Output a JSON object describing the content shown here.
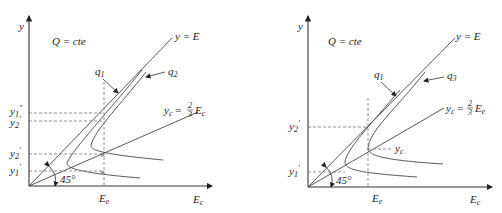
{
  "left_panel": {
    "y_axis_label": "y",
    "x_axis_label": "E",
    "x_axis_label_sub": "c",
    "condition": "Q = cte",
    "line_label": "y = E",
    "curve_labels": {
      "q1": "q",
      "q1_sub": "1",
      "q2": "q",
      "q2_sub": "2"
    },
    "critical_line": {
      "lhs": "y",
      "lhs_sub": "c",
      "eq": "=",
      "num": "2",
      "den": "3",
      "rhs": "E",
      "rhs_sub": "c"
    },
    "x_tick": {
      "label": "E",
      "sub": "e"
    },
    "y_ticks": [
      {
        "label": "y",
        "sub": "1",
        "sup": "\""
      },
      {
        "label": "y",
        "sub": "2",
        "sup": "'"
      },
      {
        "label": "y",
        "sub": "2",
        "sup": "'"
      },
      {
        "label": "y",
        "sub": "1",
        "sup": "'"
      }
    ],
    "angle_label": "45°"
  },
  "right_panel": {
    "y_axis_label": "y",
    "x_axis_label": "E",
    "x_axis_label_sub": "c",
    "condition": "Q = cte",
    "line_label": "y = E",
    "curve_labels": {
      "q1": "q",
      "q1_sub": "1",
      "q3": "q",
      "q3_sub": "3"
    },
    "critical_line": {
      "lhs": "y",
      "lhs_sub": "c",
      "eq": "=",
      "num": "2",
      "den": "3",
      "rhs": "E",
      "rhs_sub": "e"
    },
    "x_tick": {
      "label": "E",
      "sub": "e"
    },
    "critical_point_label": {
      "label": "y",
      "sub": "c"
    },
    "y_ticks": [
      {
        "label": "y",
        "sub": "2",
        "sup": "'"
      },
      {
        "label": "y",
        "sub": "1",
        "sup": "'"
      }
    ],
    "angle_label": "45°"
  }
}
